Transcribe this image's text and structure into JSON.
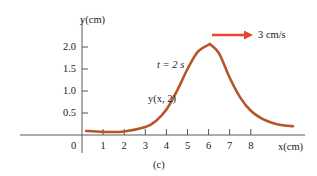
{
  "chart_data": {
    "type": "line",
    "title": "",
    "xlabel": "x(cm)",
    "ylabel": "y(cm)",
    "caption": "(c)",
    "xlim": [
      0,
      10
    ],
    "ylim": [
      0,
      2.4
    ],
    "x_ticks": [
      "1",
      "2",
      "3",
      "4",
      "5",
      "6",
      "7",
      "8"
    ],
    "y_ticks": [
      "0.5",
      "1.0",
      "1.5",
      "2.0"
    ],
    "origin_label": "0",
    "grid": false,
    "series": [
      {
        "name": "y(x, 2)",
        "color": "#b5562a",
        "x": [
          0.2,
          1,
          2,
          3,
          3.5,
          4,
          4.5,
          5,
          5.5,
          6,
          6.1,
          6.5,
          7,
          7.5,
          8,
          8.5,
          9,
          9.5,
          10
        ],
        "y": [
          0.09,
          0.07,
          0.08,
          0.18,
          0.32,
          0.58,
          1.0,
          1.5,
          1.9,
          2.05,
          2.05,
          1.85,
          1.3,
          0.85,
          0.55,
          0.38,
          0.28,
          0.22,
          0.2
        ]
      }
    ],
    "annotations": [
      {
        "text": "t = 2 s",
        "x": 3.3,
        "y": 1.55
      },
      {
        "text": "y(x, 2)",
        "x": 3.0,
        "y": 0.85
      },
      {
        "text": "3 cm/s",
        "type": "velocity-arrow",
        "direction": "right",
        "color": "#e8452c"
      }
    ]
  },
  "labels": {
    "y_axis": "y(cm)",
    "x_axis": "x(cm)",
    "time": "t = 2 s",
    "curve": "y(x, 2)",
    "speed": "3 cm/s",
    "caption": "(c)",
    "origin": "0"
  },
  "colors": {
    "curve": "#b5562a",
    "arrow": "#e8452c",
    "axis": "#555555"
  }
}
